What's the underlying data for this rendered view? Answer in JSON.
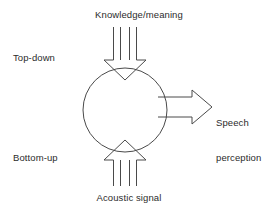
{
  "diagram": {
    "title_text": "Knowledge/meaning",
    "background_color": "#ffffff",
    "stroke_color": "#4a4a4a",
    "text_color": "#2b2b2b",
    "labels": {
      "top_input": "Knowledge/meaning",
      "left_upper": "Top-down",
      "left_lower": "Bottom-up",
      "bottom_input": "Acoustic signal",
      "output_line1": "Speech",
      "output_line2": "perception",
      "output_full": "Speech perception"
    },
    "nodes": [
      {
        "name": "central-process-circle",
        "shape": "circle",
        "cx": 125,
        "cy": 110,
        "r": 42
      }
    ],
    "arrows": [
      {
        "name": "top-down-arrow",
        "direction": "down",
        "from": "Knowledge/meaning",
        "to": "central-process-circle",
        "style": "hollow-double-shaft"
      },
      {
        "name": "bottom-up-arrow",
        "direction": "up",
        "from": "Acoustic signal",
        "to": "central-process-circle",
        "style": "hollow-double-shaft"
      },
      {
        "name": "speech-perception-arrow",
        "direction": "right",
        "from": "central-process-circle",
        "to": "Speech perception",
        "style": "hollow-block"
      }
    ]
  }
}
